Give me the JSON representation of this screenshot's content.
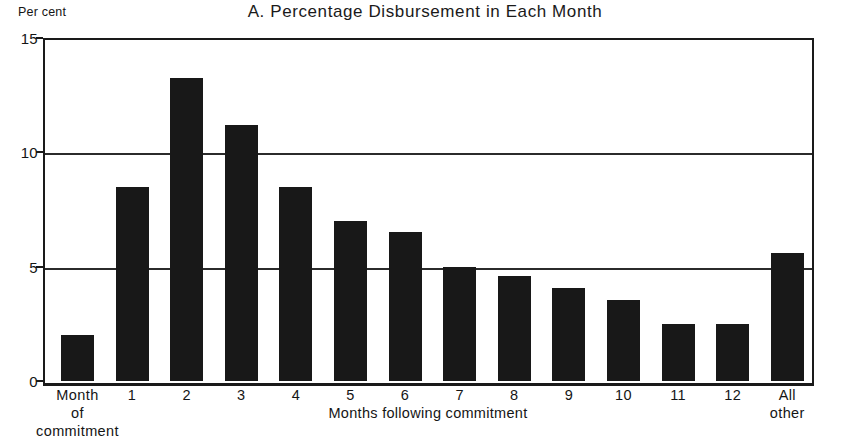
{
  "chart_data": {
    "type": "bar",
    "title": "A.  Percentage Disbursement in Each Month",
    "xlabel": "Months following commitment",
    "ylabel": "Per cent",
    "ylim": [
      0,
      15
    ],
    "yticks": [
      0,
      5,
      10,
      15
    ],
    "ytick_labels": [
      "0",
      "5",
      "10",
      "15"
    ],
    "grid": true,
    "legend": "none",
    "categories": [
      "Month\nof\ncommitment",
      "1",
      "2",
      "3",
      "4",
      "5",
      "6",
      "7",
      "8",
      "9",
      "10",
      "11",
      "12",
      "All\nother"
    ],
    "category_lines": [
      [
        "Month",
        "of",
        "commitment"
      ],
      [
        "1"
      ],
      [
        "2"
      ],
      [
        "3"
      ],
      [
        "4"
      ],
      [
        "5"
      ],
      [
        "6"
      ],
      [
        "7"
      ],
      [
        "8"
      ],
      [
        "9"
      ],
      [
        "10"
      ],
      [
        "11"
      ],
      [
        "12"
      ],
      [
        "All",
        "other"
      ]
    ],
    "values": [
      2.0,
      8.5,
      13.25,
      11.2,
      8.5,
      7.0,
      6.5,
      5.0,
      4.6,
      4.05,
      3.55,
      2.5,
      2.5,
      5.6
    ],
    "bar_color": "#181818",
    "axis_color": "#1a1a1a",
    "background_color": "#ffffff"
  }
}
